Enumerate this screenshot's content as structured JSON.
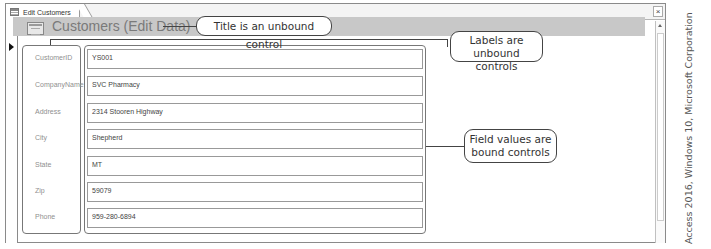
{
  "window": {
    "tab_label": "Edit Customers",
    "close_glyph": "×"
  },
  "form": {
    "title": "Customers (Edit Data)",
    "fields": [
      {
        "label": "CustomerID",
        "value": "YS001"
      },
      {
        "label": "CompanyName",
        "value": "SVC Pharmacy"
      },
      {
        "label": "Address",
        "value": "2314 Stooren Highway"
      },
      {
        "label": "City",
        "value": "Shepherd"
      },
      {
        "label": "State",
        "value": "MT"
      },
      {
        "label": "Zip",
        "value": "59079"
      },
      {
        "label": "Phone",
        "value": "959-280-6894"
      }
    ]
  },
  "callouts": {
    "title": "Title is an unbound control",
    "labels_line1": "Labels are",
    "labels_line2": "unbound controls",
    "values_line1": "Field values are",
    "values_line2": "bound controls"
  },
  "credit": "Access 2016, Windows 10, Microsoft Corporation"
}
